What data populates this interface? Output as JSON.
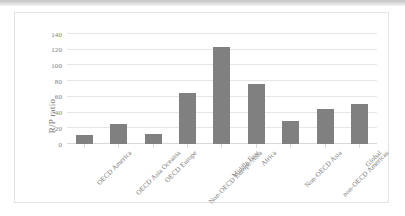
{
  "chart_data": {
    "type": "bar",
    "title": "",
    "subtitle": "",
    "xlabel": "",
    "ylabel": "R/P ratio",
    "ylim": [
      0,
      140
    ],
    "yticks": [
      0,
      20,
      40,
      60,
      80,
      100,
      120,
      140
    ],
    "ytick_labels": [
      "0",
      "20",
      "40",
      "60",
      "80",
      "100",
      "120",
      "140"
    ],
    "grid": true,
    "legend": false,
    "legend_position": "none",
    "bar_color": "#808080",
    "gridline_color": "#e6e6e6",
    "categories": [
      "OECD America",
      "OECD Asia Oceania",
      "OECD Europe",
      "Non-OECD Europe/Asia",
      "Middle East",
      "Africa",
      "Non-OECD Asia",
      "non-OECD Americas",
      "Global"
    ],
    "values": [
      11,
      26,
      13,
      65,
      123,
      76,
      29,
      45,
      51
    ]
  },
  "axis": {
    "y_title": "R/P ratio"
  }
}
